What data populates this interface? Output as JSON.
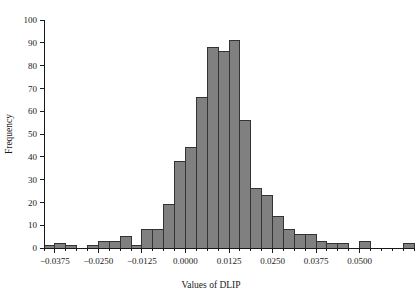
{
  "chart_data": {
    "type": "bar",
    "subtype": "histogram",
    "title": "",
    "xlabel": "Values of DLIP",
    "ylabel": "Frequency",
    "xlim": [
      -0.040625,
      0.065625
    ],
    "ylim": [
      0,
      100
    ],
    "grid": false,
    "legend": null,
    "bin_width": 0.003125,
    "x_ticks": [
      -0.0375,
      -0.025,
      -0.0125,
      0.0,
      0.0125,
      0.025,
      0.0375,
      0.05
    ],
    "x_tick_labels": [
      "-0.0375",
      "-0.0250",
      "-0.0125",
      "0.0000",
      "0.0125",
      "0.0250",
      "0.0375",
      "0.0500"
    ],
    "y_ticks": [
      0,
      10,
      20,
      30,
      40,
      50,
      60,
      70,
      80,
      90,
      100
    ],
    "y_tick_labels": [
      "0",
      "10",
      "20",
      "30",
      "40",
      "50",
      "60",
      "70",
      "80",
      "90",
      "100"
    ],
    "x": [
      -0.039063,
      -0.035938,
      -0.032813,
      -0.029688,
      -0.026563,
      -0.023438,
      -0.020313,
      -0.017188,
      -0.014063,
      -0.010938,
      -0.007813,
      -0.004688,
      -0.001563,
      0.001563,
      0.004688,
      0.007813,
      0.010938,
      0.014063,
      0.017188,
      0.020313,
      0.023438,
      0.026563,
      0.029688,
      0.032813,
      0.035938,
      0.039063,
      0.042188,
      0.045313,
      0.048438,
      0.051563,
      0.054688,
      0.057813,
      0.060938,
      0.064063
    ],
    "bin_edges": [
      -0.040625,
      -0.0375,
      -0.034375,
      -0.03125,
      -0.028125,
      -0.025,
      -0.021875,
      -0.01875,
      -0.015625,
      -0.0125,
      -0.009375,
      -0.00625,
      -0.003125,
      0.0,
      0.003125,
      0.00625,
      0.009375,
      0.0125,
      0.015625,
      0.01875,
      0.021875,
      0.025,
      0.028125,
      0.03125,
      0.034375,
      0.0375,
      0.040625,
      0.04375,
      0.046875,
      0.05,
      0.053125,
      0.05625,
      0.059375,
      0.0625,
      0.065625
    ],
    "categories": [
      "-0.0391",
      "-0.0359",
      "-0.0328",
      "-0.0297",
      "-0.0266",
      "-0.0234",
      "-0.0203",
      "-0.0172",
      "-0.0141",
      "-0.0109",
      "-0.0078",
      "-0.0047",
      "-0.0016",
      "0.0016",
      "0.0047",
      "0.0078",
      "0.0109",
      "0.0141",
      "0.0172",
      "0.0203",
      "0.0234",
      "0.0266",
      "0.0297",
      "0.0328",
      "0.0359",
      "0.0391",
      "0.0422",
      "0.0453",
      "0.0484",
      "0.0516",
      "0.0547",
      "0.0578",
      "0.0609",
      "0.0641"
    ],
    "values": [
      1,
      2,
      1,
      0,
      1,
      3,
      3,
      5,
      1,
      8,
      8,
      19,
      38,
      44,
      66,
      88,
      86,
      91,
      56,
      26,
      23,
      14,
      8,
      6,
      6,
      3,
      2,
      2,
      0,
      3,
      0,
      0,
      0,
      2
    ],
    "series": [
      {
        "name": "Frequency",
        "values": [
          1,
          2,
          1,
          0,
          1,
          3,
          3,
          5,
          1,
          8,
          8,
          19,
          38,
          44,
          66,
          88,
          86,
          91,
          56,
          26,
          23,
          14,
          8,
          6,
          6,
          3,
          2,
          2,
          0,
          3,
          0,
          0,
          0,
          2
        ]
      }
    ],
    "colors": {
      "bar_fill": "#808080",
      "bar_edge": "#333333",
      "axis": "#1a1a1a",
      "background": "#ffffff",
      "text": "#1a1a1a"
    }
  },
  "axes": {
    "y_axis_label": "Frequency",
    "x_axis_label": "Values of DLIP"
  }
}
